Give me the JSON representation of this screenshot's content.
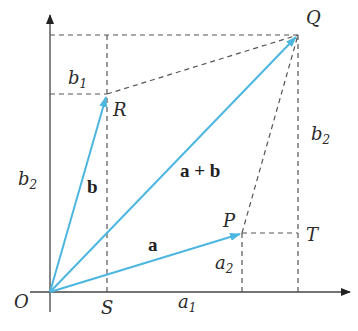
{
  "diagram": {
    "colors": {
      "vector": "#4db6e0",
      "axis": "#444444",
      "dashed": "#555555",
      "text": "#2a2a2a"
    },
    "points": {
      "O": {
        "label": "O",
        "x": 50,
        "y": 292
      },
      "S": {
        "label": "S",
        "x": 107,
        "y": 292
      },
      "R": {
        "label": "R",
        "x": 107,
        "y": 94
      },
      "P": {
        "label": "P",
        "x": 242,
        "y": 233
      },
      "Q": {
        "label": "Q",
        "x": 298,
        "y": 35
      },
      "T": {
        "label": "T",
        "x": 298,
        "y": 233
      }
    },
    "vectors": [
      {
        "name": "a",
        "label": "a",
        "from": "O",
        "to": "P"
      },
      {
        "name": "b",
        "label": "b",
        "from": "O",
        "to": "R"
      },
      {
        "name": "a_plus_b",
        "label": "a + b",
        "from": "O",
        "to": "Q"
      }
    ],
    "labels": {
      "O": "O",
      "S": "S",
      "R": "R",
      "P": "P",
      "Q": "Q",
      "T": "T",
      "a": "a",
      "b": "b",
      "a_plus_b": "a + b",
      "a1_base": "a",
      "a1_sub": "1",
      "a2_base": "a",
      "a2_sub": "2",
      "b1_base": "b",
      "b1_sub": "1",
      "b2_left_base": "b",
      "b2_left_sub": "2",
      "b2_right_base": "b",
      "b2_right_sub": "2"
    }
  }
}
